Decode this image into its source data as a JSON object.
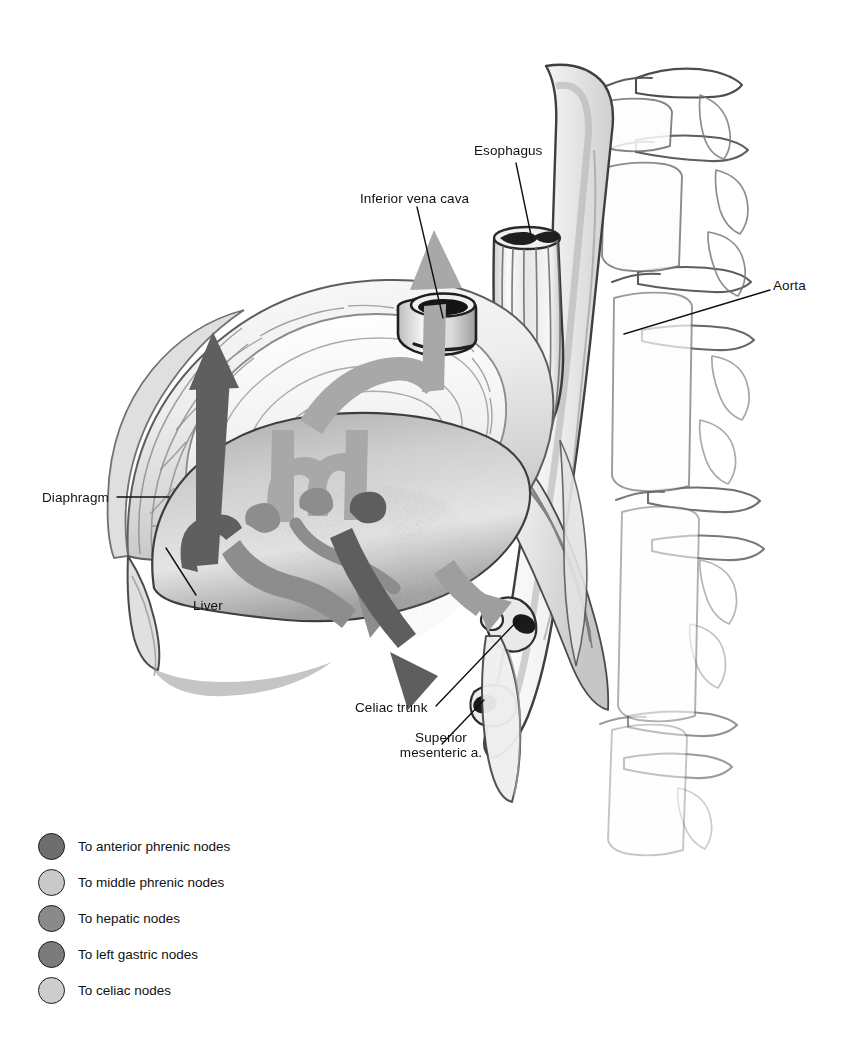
{
  "figure": {
    "background": "#ffffff",
    "width": 851,
    "height": 1055
  },
  "labels": [
    {
      "id": "inferior-vena-cava",
      "text": "Inferior vena cava",
      "x": 360,
      "y": 198,
      "align": "left"
    },
    {
      "id": "esophagus",
      "text": "Esophagus",
      "x": 474,
      "y": 150,
      "align": "left"
    },
    {
      "id": "aorta",
      "text": "Aorta",
      "x": 773,
      "y": 285,
      "align": "left"
    },
    {
      "id": "diaphragm",
      "text": "Diaphragm",
      "x": 42,
      "y": 497,
      "align": "left"
    },
    {
      "id": "liver",
      "text": "Liver",
      "x": 193,
      "y": 605,
      "align": "left"
    },
    {
      "id": "celiac-trunk",
      "text": "Celiac trunk",
      "x": 355,
      "y": 707,
      "align": "left"
    },
    {
      "id": "superior-mesenteric-artery",
      "text": "Superior\nmesenteric a.",
      "x": 381,
      "y": 737,
      "align": "center"
    }
  ],
  "legend": {
    "items": [
      {
        "id": "anterior-phrenic",
        "label": "To anterior phrenic nodes",
        "color": "#6e6e6e"
      },
      {
        "id": "middle-phrenic",
        "label": "To middle phrenic nodes",
        "color": "#c9c9c9"
      },
      {
        "id": "hepatic",
        "label": "To hepatic nodes",
        "color": "#8a8a8a"
      },
      {
        "id": "left-gastric",
        "label": "To left gastric nodes",
        "color": "#7b7b7b"
      },
      {
        "id": "celiac",
        "label": "To celiac nodes",
        "color": "#cdcdcd"
      }
    ]
  },
  "structures": [
    {
      "id": "diaphragm",
      "name": "Diaphragm dome with central tendon"
    },
    {
      "id": "liver",
      "name": "Liver, inferior surface"
    },
    {
      "id": "aorta",
      "name": "Abdominal aorta"
    },
    {
      "id": "esophagus",
      "name": "Esophagus, cut end"
    },
    {
      "id": "ivc",
      "name": "Inferior vena cava, cut cuff"
    },
    {
      "id": "spine",
      "name": "Lumbar vertebral column"
    },
    {
      "id": "celiac-trunk",
      "name": "Celiac trunk stump"
    },
    {
      "id": "superior-mesenteric-a",
      "name": "Superior mesenteric artery stump"
    },
    {
      "id": "crura",
      "name": "Diaphragmatic crura"
    }
  ],
  "arrows": [
    {
      "id": "arrow-anterior-phrenic",
      "tone": "#5f5f5f",
      "direction": "up-left"
    },
    {
      "id": "arrow-middle-phrenic-1",
      "tone": "#a3a3a3",
      "direction": "up"
    },
    {
      "id": "arrow-middle-phrenic-2",
      "tone": "#a3a3a3",
      "direction": "up"
    },
    {
      "id": "arrow-middle-phrenic-3",
      "tone": "#a3a3a3",
      "direction": "up"
    },
    {
      "id": "arrow-hepatic-1",
      "tone": "#8d8d8d",
      "direction": "down-right"
    },
    {
      "id": "arrow-hepatic-2",
      "tone": "#8d8d8d",
      "direction": "down-right"
    },
    {
      "id": "arrow-left-gastric",
      "tone": "#5e5e5e",
      "direction": "down-right"
    },
    {
      "id": "arrow-celiac",
      "tone": "#9a9a9a",
      "direction": "down-right"
    }
  ]
}
